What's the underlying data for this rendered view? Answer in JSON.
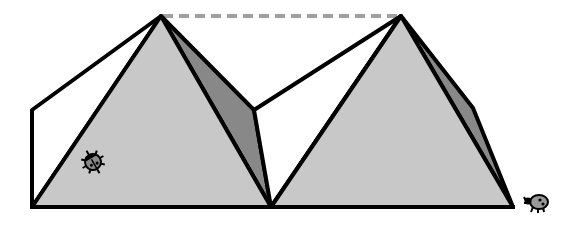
{
  "diagram": {
    "colors": {
      "front_face": "#c8c8c8",
      "side_face": "#888888",
      "outline": "#000000",
      "dashed_line": "#a0a0a0",
      "background": "#ffffff"
    },
    "pyramids": [
      {
        "name": "left-pyramid",
        "apex": [
          161,
          16
        ],
        "base_left": [
          32,
          207
        ],
        "base_right": [
          271,
          207
        ]
      },
      {
        "name": "right-pyramid",
        "apex": [
          401,
          16
        ],
        "base_left": [
          271,
          207
        ],
        "base_right": [
          513,
          207
        ]
      }
    ],
    "dashed_line": {
      "from": [
        161,
        16
      ],
      "to": [
        401,
        16
      ]
    },
    "ladybugs": [
      {
        "name": "ladybug-on-pyramid",
        "position": [
          93,
          162
        ]
      },
      {
        "name": "ladybug-on-ground",
        "position": [
          537,
          203
        ]
      }
    ]
  }
}
